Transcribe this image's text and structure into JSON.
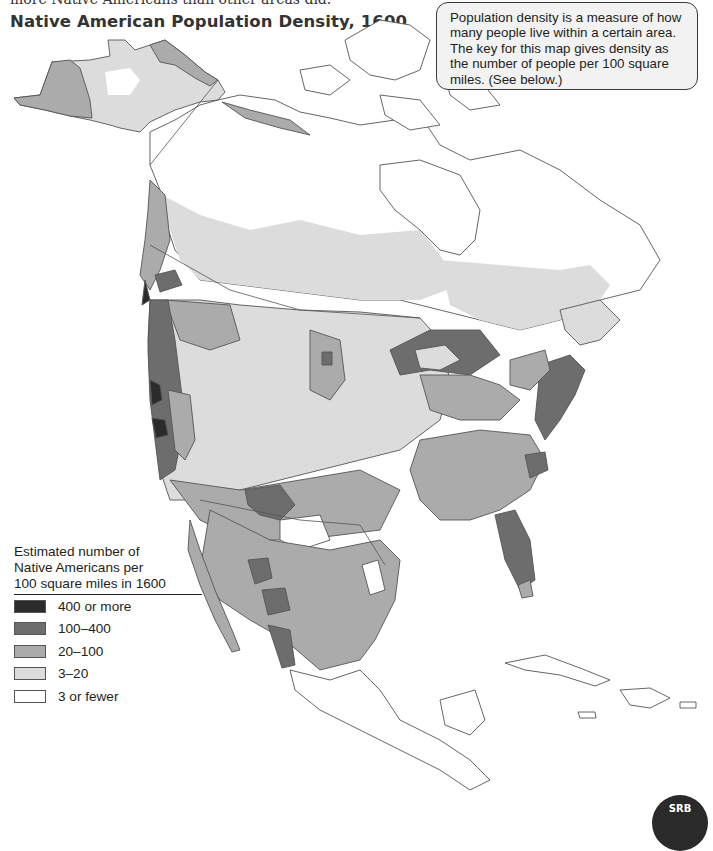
{
  "header": {
    "cut_off_text": "more Native Americans than other areas did.",
    "title": "Native American Population Density, 1600"
  },
  "callout": {
    "text": "Population density is a measure of how many people live within a certain area. The key for this map gives density as the number of people per 100 square miles. (See below.)"
  },
  "legend": {
    "title_lines": [
      "Estimated number of",
      "Native Americans per",
      "100 square miles in 1600"
    ],
    "items": [
      {
        "label": "400 or more",
        "color": "#2b2b2b"
      },
      {
        "label": "100–400",
        "color": "#6d6d6d"
      },
      {
        "label": "20–100",
        "color": "#ababab"
      },
      {
        "label": "3–20",
        "color": "#dcdcdc"
      },
      {
        "label": "3 or fewer",
        "color": "#ffffff"
      }
    ]
  },
  "badge": {
    "label": "SRB"
  },
  "map": {
    "border_color": "#555555",
    "colors": {
      "very_high": "#2b2b2b",
      "high": "#6d6d6d",
      "medium": "#ababab",
      "low": "#dcdcdc",
      "very_low": "#ffffff"
    }
  }
}
